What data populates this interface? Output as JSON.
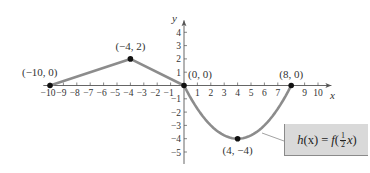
{
  "chart_data": {
    "type": "line",
    "title": "",
    "xlabel": "x",
    "ylabel": "y",
    "xlim": [
      -10.5,
      11
    ],
    "ylim": [
      -5.5,
      5
    ],
    "grid": false,
    "x_ticks": [
      -10,
      -9,
      -8,
      -7,
      -6,
      -5,
      -4,
      -3,
      -2,
      -1,
      1,
      2,
      3,
      4,
      5,
      6,
      7,
      9,
      10
    ],
    "y_ticks": [
      -5,
      -4,
      -3,
      -2,
      -1,
      1,
      2,
      3,
      4
    ],
    "series": [
      {
        "name": "h(x) = f(1/2 x)",
        "color": "#8c8c8c",
        "segments": [
          {
            "kind": "linear",
            "points": [
              [
                -10,
                0
              ],
              [
                -4,
                2
              ]
            ]
          },
          {
            "kind": "linear",
            "points": [
              [
                -4,
                2
              ],
              [
                0,
                0
              ]
            ]
          },
          {
            "kind": "parabola",
            "points": [
              [
                0,
                0
              ],
              [
                4,
                -4
              ],
              [
                8,
                0
              ]
            ]
          }
        ]
      }
    ],
    "annotations": [
      {
        "label": "(−10, 0)",
        "x": -10,
        "y": 0
      },
      {
        "label": "(−4, 2)",
        "x": -4,
        "y": 2
      },
      {
        "label": "(0, 0)",
        "x": 0,
        "y": 0
      },
      {
        "label": "(8, 0)",
        "x": 8,
        "y": 0
      },
      {
        "label": "(4, −4)",
        "x": 4,
        "y": -4
      }
    ],
    "legend": {
      "position": "bottom-right",
      "label": "h(x) = f(½x)"
    }
  },
  "labels": {
    "x_axis": "x",
    "y_axis": "y",
    "fn_h": "h",
    "fn_x": "(x) = ",
    "fn_f": "f",
    "fn_open": "(",
    "fn_num": "1",
    "fn_den": "2",
    "fn_arg": "x",
    "fn_close": ")"
  },
  "colors": {
    "curve": "#8c8c8c",
    "axis": "#555555",
    "point": "#111111",
    "legend_bg": "#d9d9d9"
  }
}
